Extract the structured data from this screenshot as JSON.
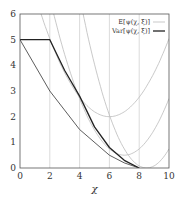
{
  "chart_data": {
    "type": "line",
    "title": "",
    "xlabel": "χ",
    "ylabel": "",
    "xlim": [
      0,
      10
    ],
    "ylim": [
      0,
      6
    ],
    "x_ticks": [
      "0",
      "2",
      "4",
      "6",
      "8",
      "10"
    ],
    "y_ticks": [
      "0",
      "1",
      "2",
      "3",
      "4",
      "5",
      "6"
    ],
    "grid": "vertical lines at x=2,4,6,8",
    "legend_position": "upper right",
    "legend": [
      {
        "label": "E[ψ(χ, ξ)]",
        "style": "thin gray"
      },
      {
        "label": "Var[ψ(χ, ξ)]",
        "style": "thick black"
      }
    ],
    "series": [
      {
        "name": "Var[ψ(χ, ξ)]",
        "x": [
          0,
          2,
          3,
          4,
          5,
          6,
          7,
          8
        ],
        "y": [
          5,
          5,
          3.8,
          2.8,
          1.6,
          0.8,
          0.3,
          0
        ]
      },
      {
        "name": "lower bound (thin black)",
        "x": [
          0,
          2,
          4,
          6,
          7,
          8
        ],
        "y": [
          5,
          3,
          1.5,
          0.5,
          0.2,
          0
        ]
      },
      {
        "name": "gray parabola 1",
        "x": [
          2.5,
          4,
          6,
          8,
          10
        ],
        "y": [
          6,
          2.8,
          2,
          2.75,
          5
        ]
      },
      {
        "name": "gray parabola 2",
        "x": [
          3.3,
          5,
          7,
          8.5,
          10
        ],
        "y": [
          6,
          1.5,
          0.5,
          1.05,
          2.7
        ]
      },
      {
        "name": "gray parabola 3",
        "x": [
          4.2,
          6,
          8.5,
          10
        ],
        "y": [
          6,
          2,
          0,
          0.75
        ]
      }
    ]
  }
}
